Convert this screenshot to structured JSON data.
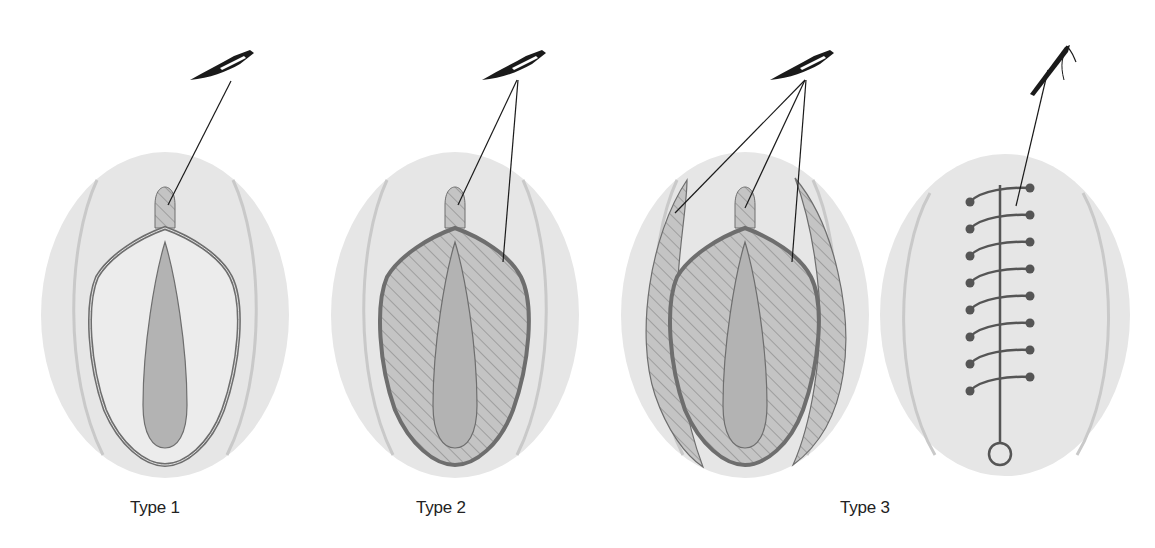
{
  "figure": {
    "panels": [
      {
        "id": "type1",
        "label": "Type 1",
        "label_x": 130,
        "cx": 165,
        "incisions": 1,
        "hatched_body": false,
        "side_flaps": false
      },
      {
        "id": "type2",
        "label": "Type 2",
        "label_x": 416,
        "cx": 455,
        "incisions": 2,
        "hatched_body": true,
        "side_flaps": false
      },
      {
        "id": "type3",
        "label": "Type 3",
        "label_x": 840,
        "cx": 745,
        "incisions": 4,
        "hatched_body": true,
        "side_flaps": true
      },
      {
        "id": "closure",
        "label": "",
        "cx": 1005,
        "suture_stitches": 8
      }
    ],
    "icons": {
      "scalpel": "scalpel-icon",
      "needle": "suture-needle-icon"
    },
    "colors": {
      "background": "#ffffff",
      "outer_oval": "#e6e6e6",
      "outer_arc": "#c9c9c9",
      "inner_fill": "#ececec",
      "outline": "#6e6e6e",
      "core": "#b3b3b3",
      "hatch": "#8a8a8a",
      "ink": "#1a1a1a",
      "suture": "#555555"
    }
  }
}
